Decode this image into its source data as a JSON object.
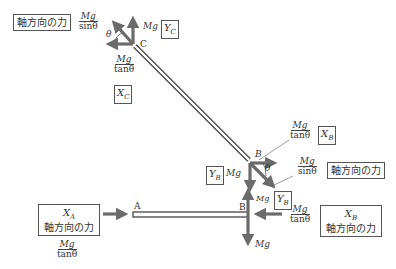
{
  "diagram": {
    "type": "free-body force diagram",
    "points": {
      "A": "A",
      "B_upper": "B",
      "B_lower": "B",
      "C": "C"
    },
    "axial_force_label": "軸方向の力",
    "mg": "Mg",
    "mg_over_sin": {
      "num": "Mg",
      "den": "sinθ"
    },
    "mg_over_tan": {
      "num": "Mg",
      "den": "tanθ"
    },
    "theta": "θ",
    "vars": {
      "XC": "X",
      "XC_sub": "C",
      "YC": "Y",
      "YC_sub": "C",
      "XB": "X",
      "XB_sub": "B",
      "YB": "Y",
      "YB_sub": "B",
      "XA": "X",
      "XA_sub": "A"
    },
    "colors": {
      "arrow": "#6b6b6b",
      "member_outline": "#444444",
      "box_border": "#555555"
    }
  }
}
